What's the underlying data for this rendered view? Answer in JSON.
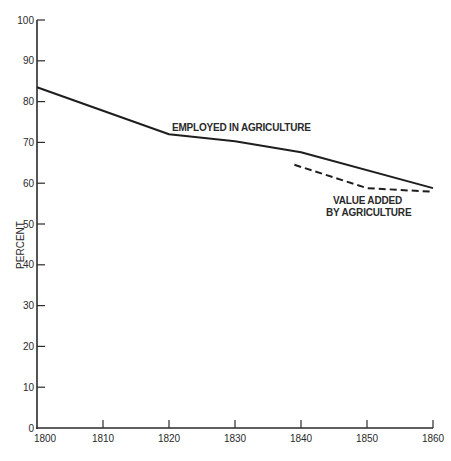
{
  "chart_data": {
    "type": "line",
    "title": "",
    "xlabel": "",
    "ylabel": "PERCENT",
    "xlim": [
      1800,
      1860
    ],
    "ylim": [
      0,
      100
    ],
    "x_ticks": [
      1800,
      1810,
      1820,
      1830,
      1840,
      1850,
      1860
    ],
    "y_ticks": [
      0,
      10,
      20,
      30,
      40,
      50,
      60,
      70,
      80,
      90,
      100
    ],
    "grid": false,
    "legend": "none (inline annotations)",
    "series": [
      {
        "name": "EMPLOYED IN AGRICULTURE",
        "style": "solid",
        "x": [
          1800,
          1820,
          1830,
          1840,
          1860
        ],
        "values": [
          83.5,
          72,
          70.3,
          67.6,
          58.8
        ]
      },
      {
        "name": "VALUE ADDED BY AGRICULTURE",
        "style": "dashed",
        "x": [
          1839,
          1850,
          1860
        ],
        "values": [
          64.5,
          58.8,
          57.9
        ]
      }
    ],
    "annotations": [
      {
        "text": "EMPLOYED IN AGRICULTURE",
        "near_x": 1828,
        "near_y": 75
      },
      {
        "text": "VALUE ADDED",
        "near_x": 1853,
        "near_y": 55
      },
      {
        "text": "BY AGRICULTURE",
        "near_x": 1853,
        "near_y": 52
      }
    ]
  },
  "labels": {
    "ylabel": "PERCENT",
    "employed": "EMPLOYED IN AGRICULTURE",
    "value_line1": "VALUE ADDED",
    "value_line2": "BY AGRICULTURE"
  }
}
